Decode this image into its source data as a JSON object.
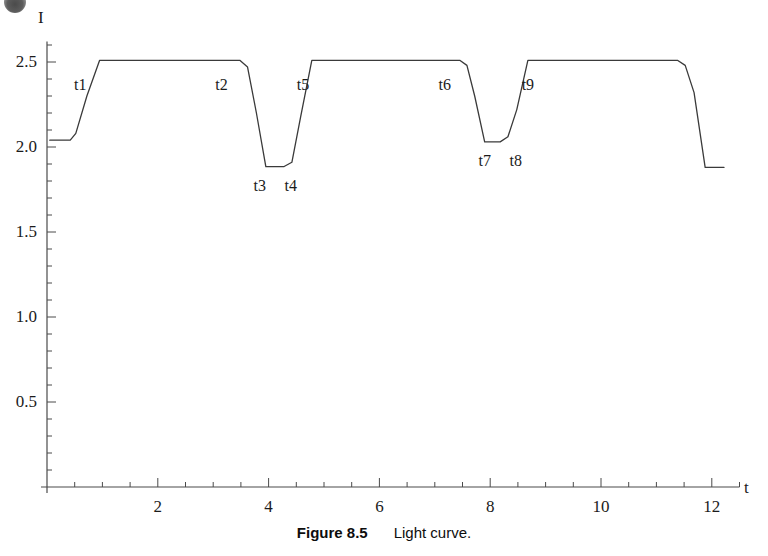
{
  "figure": {
    "caption_number": "Figure 8.5",
    "caption_text": "Light curve.",
    "corner_mark_name": "page-scan-artifact"
  },
  "chart_data": {
    "type": "line",
    "title": "",
    "subtitle": "",
    "xlabel": "t",
    "ylabel": "I",
    "xlim": [
      0,
      12.5
    ],
    "ylim": [
      0,
      2.62
    ],
    "grid": false,
    "legend": "none",
    "x_ticks": [
      2,
      4,
      6,
      8,
      10,
      12
    ],
    "x_tick_labels": [
      "2",
      "4",
      "6",
      "8",
      "10",
      "12"
    ],
    "x_minor_tick_step": 0.5,
    "y_ticks": [
      0.5,
      1.0,
      1.5,
      2.0,
      2.5
    ],
    "y_tick_labels": [
      "0.5",
      "1.0",
      "1.5",
      "2.0",
      "2.5"
    ],
    "y_minor_tick_step": 0.1,
    "line_color": "#3a3a3a",
    "line_width": 1.3,
    "baseline_level": 2.04,
    "plateau_level": 2.51,
    "primary_minimum": 1.88,
    "secondary_minimum": 2.03,
    "final_level": 1.88,
    "series": [
      {
        "name": "Light curve",
        "x": [
          0.05,
          0.42,
          0.52,
          0.72,
          0.95,
          3.48,
          3.62,
          3.78,
          3.95,
          4.28,
          4.42,
          4.58,
          4.78,
          7.45,
          7.58,
          7.72,
          7.9,
          8.18,
          8.32,
          8.48,
          8.68,
          11.38,
          11.52,
          11.68,
          11.88,
          12.22
        ],
        "y": [
          2.04,
          2.04,
          2.08,
          2.3,
          2.51,
          2.51,
          2.47,
          2.2,
          1.885,
          1.885,
          1.91,
          2.18,
          2.51,
          2.51,
          2.48,
          2.3,
          2.03,
          2.03,
          2.06,
          2.22,
          2.51,
          2.51,
          2.48,
          2.32,
          1.88,
          1.88
        ]
      }
    ],
    "annotations": [
      {
        "label": "t1",
        "x": 0.6,
        "y": 2.51,
        "dx": 0,
        "dy": 16
      },
      {
        "label": "t2",
        "x": 3.15,
        "y": 2.51,
        "dx": 0,
        "dy": 16
      },
      {
        "label": "t3",
        "x": 3.84,
        "y": 1.885,
        "dx": 0,
        "dy": 10
      },
      {
        "label": "t4",
        "x": 4.4,
        "y": 1.885,
        "dx": 0,
        "dy": 10
      },
      {
        "label": "t5",
        "x": 4.62,
        "y": 2.51,
        "dx": 0,
        "dy": 16
      },
      {
        "label": "t6",
        "x": 7.18,
        "y": 2.51,
        "dx": 0,
        "dy": 16
      },
      {
        "label": "t7",
        "x": 7.9,
        "y": 2.03,
        "dx": 0,
        "dy": 10
      },
      {
        "label": "t8",
        "x": 8.46,
        "y": 2.03,
        "dx": 0,
        "dy": 10
      },
      {
        "label": "t9",
        "x": 8.68,
        "y": 2.51,
        "dx": 0,
        "dy": 16
      }
    ]
  }
}
